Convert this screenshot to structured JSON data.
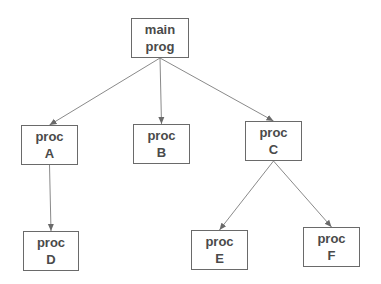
{
  "diagram": {
    "type": "tree",
    "colors": {
      "line": "#8a8a8a",
      "box_border": "#6a6a6a",
      "text": "#4a4a4a",
      "background": "#ffffff"
    },
    "nodes": [
      {
        "id": "main",
        "line1": "main",
        "line2": "prog",
        "x": 131,
        "y": 18,
        "w": 58,
        "h": 40
      },
      {
        "id": "A",
        "line1": "proc",
        "line2": "A",
        "x": 21,
        "y": 125,
        "w": 57,
        "h": 40
      },
      {
        "id": "B",
        "line1": "proc",
        "line2": "B",
        "x": 133,
        "y": 124,
        "w": 57,
        "h": 40
      },
      {
        "id": "C",
        "line1": "proc",
        "line2": "C",
        "x": 245,
        "y": 121,
        "w": 57,
        "h": 40
      },
      {
        "id": "D",
        "line1": "proc",
        "line2": "D",
        "x": 23,
        "y": 231,
        "w": 56,
        "h": 40
      },
      {
        "id": "E",
        "line1": "proc",
        "line2": "E",
        "x": 191,
        "y": 230,
        "w": 57,
        "h": 40
      },
      {
        "id": "F",
        "line1": "proc",
        "line2": "F",
        "x": 303,
        "y": 227,
        "w": 57,
        "h": 40
      }
    ],
    "edges": [
      {
        "from": "main",
        "to": "A"
      },
      {
        "from": "main",
        "to": "B"
      },
      {
        "from": "main",
        "to": "C"
      },
      {
        "from": "A",
        "to": "D"
      },
      {
        "from": "C",
        "to": "E"
      },
      {
        "from": "C",
        "to": "F"
      }
    ]
  }
}
